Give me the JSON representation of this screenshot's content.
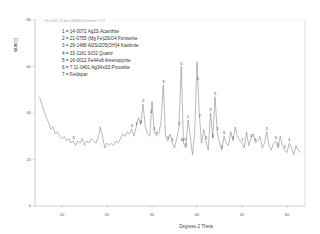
{
  "header": {
    "text": "File: 4-0122_01 Date: 2008/08/26 Comment: 1 2 3 4"
  },
  "chart_data": {
    "type": "line",
    "title": "",
    "xlabel": "Degrees 2 Theta",
    "ylabel": "Counts",
    "xlim": [
      4,
      64
    ],
    "ylim": [
      0,
      80
    ],
    "xticks": [
      10,
      20,
      30,
      40,
      50,
      60
    ],
    "yticks": [
      0,
      20,
      40,
      60,
      80
    ],
    "grid": false,
    "legend_position": "top-left inside plot",
    "legend": [
      "1 = 14-0072 Ag2S Acanthite",
      "2 = 21-0755 (Mg,Fe)2SiO4 Forsterite",
      "3 = 29-1488 Al2Si2O5(OH)4 Kaolinite",
      "4 = 33-1161 SiO2 Quartz",
      "5 = 16-0012 Fe4As6 Arsenopyrite",
      "6 = ? 11-0401 Ag3AsS3 Proustite",
      "7 = Feldspar"
    ],
    "series": [
      {
        "name": "XRD pattern",
        "x": [
          5,
          5.5,
          6,
          6.5,
          7,
          7.5,
          8,
          8.5,
          9,
          9.5,
          10,
          10.5,
          11,
          11.5,
          12,
          12.5,
          13,
          13.5,
          14,
          14.5,
          15,
          15.5,
          16,
          16.5,
          17,
          17.5,
          18,
          18.5,
          19,
          19.5,
          20,
          20.5,
          21,
          21.5,
          22,
          22.5,
          23,
          23.5,
          24,
          24.5,
          25,
          25.5,
          26,
          26.5,
          27,
          27.5,
          28,
          28.5,
          29,
          29.5,
          30,
          30.5,
          31,
          31.5,
          32,
          32.5,
          33,
          33.5,
          34,
          34.5,
          35,
          35.5,
          36,
          36.5,
          37,
          37.5,
          38,
          38.5,
          39,
          39.5,
          40,
          40.5,
          41,
          41.5,
          42,
          42.5,
          43,
          43.5,
          44,
          44.5,
          45,
          45.5,
          46,
          46.5,
          47,
          47.5,
          48,
          48.5,
          49,
          49.5,
          50,
          50.5,
          51,
          51.5,
          52,
          52.5,
          53,
          53.5,
          54,
          54.5,
          55,
          55.5,
          56,
          56.5,
          57,
          57.5,
          58,
          58.5,
          59,
          59.5,
          60,
          60.5,
          61,
          61.5,
          62,
          62.5,
          63
        ],
        "y": [
          47,
          44,
          41,
          38,
          36,
          33,
          34,
          31,
          32,
          30,
          29,
          30,
          28,
          29,
          27,
          28,
          26,
          28,
          27,
          29,
          26,
          28,
          27,
          29,
          28,
          27,
          29,
          34,
          30,
          25,
          27,
          26,
          27,
          26,
          28,
          27,
          29,
          31,
          30,
          32,
          31,
          33,
          30,
          34,
          38,
          35,
          44,
          34,
          31,
          30,
          45,
          32,
          30,
          31,
          36,
          52,
          30,
          28,
          31,
          27,
          25,
          29,
          34,
          60,
          27,
          25,
          37,
          30,
          22,
          32,
          62,
          40,
          27,
          33,
          28,
          24,
          40,
          29,
          47,
          32,
          27,
          24,
          30,
          27,
          26,
          32,
          28,
          34,
          30,
          28,
          27,
          25,
          32,
          26,
          29,
          31,
          27,
          28,
          30,
          25,
          27,
          32,
          26,
          24,
          27,
          28,
          25,
          30,
          26,
          24,
          23,
          27,
          25,
          22,
          26,
          24,
          23
        ]
      }
    ],
    "peak_annotations": [
      {
        "x": 12.5,
        "label": "3"
      },
      {
        "x": 25.5,
        "label": "3"
      },
      {
        "x": 26.5,
        "label": "1"
      },
      {
        "x": 27.5,
        "label": "4"
      },
      {
        "x": 28.0,
        "label": "2"
      },
      {
        "x": 29.8,
        "label": "1"
      },
      {
        "x": 30.5,
        "label": "1"
      },
      {
        "x": 31.0,
        "label": "4"
      },
      {
        "x": 32.5,
        "label": "3"
      },
      {
        "x": 33.5,
        "label": "1"
      },
      {
        "x": 34.5,
        "label": "1"
      },
      {
        "x": 36.0,
        "label": "2"
      },
      {
        "x": 36.5,
        "label": "5"
      },
      {
        "x": 37.0,
        "label": "6/7"
      },
      {
        "x": 37.5,
        "label": "5"
      },
      {
        "x": 38.0,
        "label": "1"
      },
      {
        "x": 40.2,
        "label": "1"
      },
      {
        "x": 40.6,
        "label": "7"
      },
      {
        "x": 42.0,
        "label": "2"
      },
      {
        "x": 43.0,
        "label": "2"
      },
      {
        "x": 43.5,
        "label": "1"
      },
      {
        "x": 44.0,
        "label": "5"
      },
      {
        "x": 44.5,
        "label": "1"
      },
      {
        "x": 45.5,
        "label": "1"
      },
      {
        "x": 46.0,
        "label": "5"
      },
      {
        "x": 48.0,
        "label": "1"
      },
      {
        "x": 50.0,
        "label": "1"
      },
      {
        "x": 52.0,
        "label": "1"
      },
      {
        "x": 53.0,
        "label": "1"
      },
      {
        "x": 55.5,
        "label": "1"
      },
      {
        "x": 57.5,
        "label": "5"
      },
      {
        "x": 58.0,
        "label": "1"
      },
      {
        "x": 59.5,
        "label": "1"
      },
      {
        "x": 60.5,
        "label": "1"
      }
    ]
  },
  "colors": {
    "line": "#8a8a8a",
    "axis": "#b0b0b0",
    "text": "#333333"
  }
}
